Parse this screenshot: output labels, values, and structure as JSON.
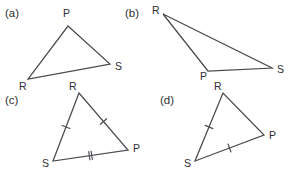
{
  "figure": {
    "width": 291,
    "height": 175,
    "background": "#ffffff",
    "stroke_color": "#4a4a50",
    "text_color": "#2e2e33"
  },
  "panels": [
    {
      "id": "a",
      "label": "(a)",
      "label_pos": {
        "x": 5,
        "y": 17
      },
      "vertices": [
        {
          "name": "P",
          "x": 68,
          "y": 26,
          "label_x": 63,
          "label_y": 17
        },
        {
          "name": "S",
          "x": 110,
          "y": 64,
          "label_x": 115,
          "label_y": 70
        },
        {
          "name": "R",
          "x": 28,
          "y": 79,
          "label_x": 19,
          "label_y": 90
        }
      ],
      "ticks": []
    },
    {
      "id": "b",
      "label": "(b)",
      "label_pos": {
        "x": 125,
        "y": 17
      },
      "vertices": [
        {
          "name": "R",
          "x": 163,
          "y": 14,
          "label_x": 152,
          "label_y": 14
        },
        {
          "name": "P",
          "x": 208,
          "y": 71,
          "label_x": 200,
          "label_y": 80
        },
        {
          "name": "S",
          "x": 272,
          "y": 68,
          "label_x": 277,
          "label_y": 73
        }
      ],
      "ticks": []
    },
    {
      "id": "c",
      "label": "(c)",
      "label_pos": {
        "x": 5,
        "y": 104
      },
      "vertices": [
        {
          "name": "R",
          "x": 79,
          "y": 93,
          "label_x": 69,
          "label_y": 90
        },
        {
          "name": "S",
          "x": 53,
          "y": 161,
          "label_x": 42,
          "label_y": 167
        },
        {
          "name": "P",
          "x": 128,
          "y": 150,
          "label_x": 133,
          "label_y": 152
        }
      ],
      "ticks": [
        {
          "edge": "S-R",
          "count": 1,
          "from": "S",
          "to": "R"
        },
        {
          "edge": "R-P",
          "count": 1,
          "from": "R",
          "to": "P"
        },
        {
          "edge": "S-P",
          "count": 2,
          "from": "S",
          "to": "P"
        }
      ]
    },
    {
      "id": "d",
      "label": "(d)",
      "label_pos": {
        "x": 160,
        "y": 104
      },
      "vertices": [
        {
          "name": "R",
          "x": 223,
          "y": 93,
          "label_x": 214,
          "label_y": 90
        },
        {
          "name": "S",
          "x": 195,
          "y": 161,
          "label_x": 184,
          "label_y": 167
        },
        {
          "name": "P",
          "x": 264,
          "y": 135,
          "label_x": 269,
          "label_y": 139
        }
      ],
      "ticks": [
        {
          "edge": "S-R",
          "count": 1,
          "from": "S",
          "to": "R"
        },
        {
          "edge": "S-P",
          "count": 1,
          "from": "S",
          "to": "P"
        }
      ]
    }
  ]
}
